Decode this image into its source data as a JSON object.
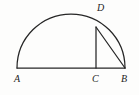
{
  "figure": {
    "kind": "geometry-diagram",
    "background_color": "#fdfdfc",
    "stroke_color": "#262626",
    "label_color": "#1d1d1d",
    "labels": {
      "a": "A",
      "b": "B",
      "c": "C",
      "d": "D"
    },
    "geometry": {
      "baseline_y": 68,
      "point_a": {
        "x": 17,
        "y": 68
      },
      "point_b": {
        "x": 125,
        "y": 68
      },
      "point_c": {
        "x": 96,
        "y": 68
      },
      "point_d": {
        "x": 96,
        "y": 27
      },
      "circle_center": {
        "x": 71,
        "y": 68
      },
      "circle_radius": 54,
      "arc_apex": {
        "x": 71,
        "y": 14
      }
    },
    "segments": [
      {
        "name": "diameter-ab",
        "from": "A",
        "to": "B"
      },
      {
        "name": "altitude-cd",
        "from": "C",
        "to": "D"
      },
      {
        "name": "chord-db",
        "from": "D",
        "to": "B"
      }
    ],
    "arcs": [
      {
        "name": "semicircle-arc-ab",
        "from": "A",
        "to": "B",
        "through": "top"
      }
    ]
  }
}
